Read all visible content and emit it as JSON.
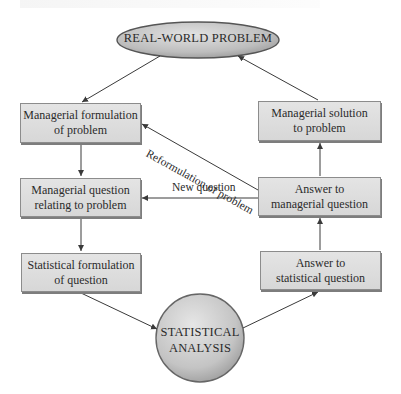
{
  "diagram": {
    "type": "flowchart",
    "start_node": {
      "id": "real-world-problem",
      "label": "REAL-WORLD PROBLEM",
      "shape": "ellipse"
    },
    "left_column": [
      {
        "id": "managerial-formulation",
        "label": "Managerial formulation\nof problem"
      },
      {
        "id": "managerial-question",
        "label": "Managerial question\nrelating to problem"
      },
      {
        "id": "statistical-formulation",
        "label": "Statistical formulation\nof question"
      }
    ],
    "center_node": {
      "id": "statistical-analysis",
      "label": "STATISTICAL\nANALYSIS",
      "shape": "circle"
    },
    "right_column": [
      {
        "id": "managerial-solution",
        "label": "Managerial solution\nto problem"
      },
      {
        "id": "answer-managerial",
        "label": "Answer to\nmanagerial question"
      },
      {
        "id": "answer-statistical",
        "label": "Answer to\nstatistical question"
      }
    ],
    "edges": [
      {
        "from": "real-world-problem",
        "to": "managerial-formulation",
        "label": ""
      },
      {
        "from": "managerial-formulation",
        "to": "managerial-question",
        "label": ""
      },
      {
        "from": "managerial-question",
        "to": "statistical-formulation",
        "label": ""
      },
      {
        "from": "statistical-formulation",
        "to": "statistical-analysis",
        "label": ""
      },
      {
        "from": "statistical-analysis",
        "to": "answer-statistical",
        "label": ""
      },
      {
        "from": "answer-statistical",
        "to": "answer-managerial",
        "label": ""
      },
      {
        "from": "answer-managerial",
        "to": "managerial-solution",
        "label": ""
      },
      {
        "from": "managerial-solution",
        "to": "real-world-problem",
        "label": ""
      },
      {
        "from": "answer-managerial",
        "to": "managerial-question",
        "label": "New question"
      },
      {
        "from": "answer-managerial",
        "to": "managerial-formulation",
        "label": "Reformulation of problem"
      }
    ],
    "edge_labels": {
      "new_question": "New question",
      "reformulation": "Reformulation of problem"
    },
    "colors": {
      "box_fill": "#dcdcdc",
      "box_border": "#8c8c8c",
      "node_fill": "#c8c8c8",
      "arrow": "#3a3a3a",
      "text": "#2a2a2a"
    }
  }
}
